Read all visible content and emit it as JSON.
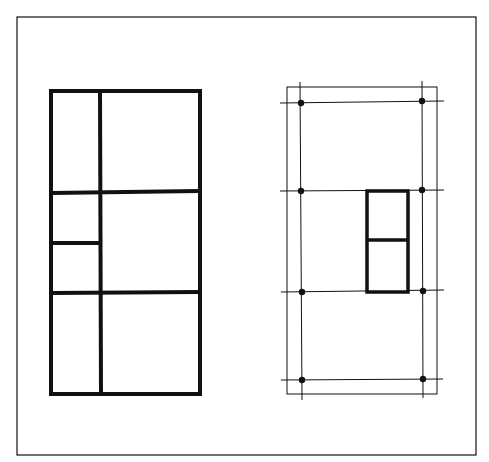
{
  "canvas": {
    "width": 489,
    "height": 462,
    "background": "#ffffff",
    "ink": "#111111"
  },
  "frame": {
    "x": 17,
    "y": 17,
    "w": 459,
    "h": 438,
    "stroke": 1.2
  },
  "left_figure": {
    "stroke": 4,
    "outer": {
      "x": 51,
      "y": 91,
      "w": 149,
      "h": 303
    },
    "lines": [
      {
        "x1": 100,
        "y1": 91,
        "x2": 101,
        "y2": 394
      },
      {
        "x1": 51,
        "y1": 193,
        "x2": 199,
        "y2": 191
      },
      {
        "x1": 51,
        "y1": 293,
        "x2": 199,
        "y2": 292
      },
      {
        "x1": 51,
        "y1": 243,
        "x2": 99,
        "y2": 243
      }
    ]
  },
  "right_figure": {
    "outer": {
      "x": 287,
      "y": 87,
      "w": 150,
      "h": 307,
      "stroke": 1
    },
    "grid_stroke": 1,
    "vertical_lines": [
      {
        "x1": 300,
        "y1": 82,
        "x2": 302,
        "y2": 400
      },
      {
        "x1": 422,
        "y1": 81,
        "x2": 423,
        "y2": 398
      }
    ],
    "horizontal_lines": [
      {
        "x1": 280,
        "y1": 103,
        "x2": 444,
        "y2": 101
      },
      {
        "x1": 280,
        "y1": 191,
        "x2": 444,
        "y2": 190
      },
      {
        "x1": 281,
        "y1": 292,
        "x2": 444,
        "y2": 290
      },
      {
        "x1": 281,
        "y1": 380,
        "x2": 443,
        "y2": 379
      }
    ],
    "dots": [
      {
        "cx": 301,
        "cy": 103
      },
      {
        "cx": 422,
        "cy": 101
      },
      {
        "cx": 301,
        "cy": 191
      },
      {
        "cx": 422,
        "cy": 190
      },
      {
        "cx": 302,
        "cy": 292
      },
      {
        "cx": 423,
        "cy": 291
      },
      {
        "cx": 302,
        "cy": 380
      },
      {
        "cx": 423,
        "cy": 379
      }
    ],
    "dot_radius": 3.2,
    "inset_box": {
      "stroke": 3.5,
      "outer": {
        "x": 367,
        "y": 191,
        "w": 41,
        "h": 101
      },
      "divider": {
        "x1": 367,
        "y1": 240,
        "x2": 407,
        "y2": 240
      }
    }
  }
}
